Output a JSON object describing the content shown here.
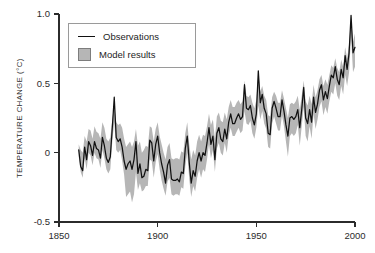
{
  "chart_data": {
    "type": "line",
    "title": "",
    "subtitle": "",
    "xlabel": "",
    "ylabel": "TEMPERATURE CHANGE (°C)",
    "xlim": [
      1850,
      2000
    ],
    "ylim": [
      -0.5,
      1.0
    ],
    "xticks": [
      1850,
      1900,
      1950,
      2000
    ],
    "xtick_labels": [
      "1850",
      "1900",
      "1950",
      "2000"
    ],
    "yticks": [
      -0.5,
      0,
      0.5,
      1.0
    ],
    "ytick_labels": [
      "-0.5",
      "0",
      "0.5",
      "1.0"
    ],
    "grid": false,
    "legend_position": "top-left",
    "legend": [
      {
        "label": "Observations",
        "marker": "line",
        "color": "#111111"
      },
      {
        "label": "Model results",
        "marker": "filled-square",
        "color": "#b6b6b6"
      }
    ],
    "series": [
      {
        "name": "Observations",
        "type": "line",
        "color": "#111111",
        "x": [
          1860,
          1861,
          1862,
          1863,
          1864,
          1865,
          1866,
          1867,
          1868,
          1869,
          1870,
          1871,
          1872,
          1873,
          1874,
          1875,
          1876,
          1877,
          1878,
          1879,
          1880,
          1881,
          1882,
          1883,
          1884,
          1885,
          1886,
          1887,
          1888,
          1889,
          1890,
          1891,
          1892,
          1893,
          1894,
          1895,
          1896,
          1897,
          1898,
          1899,
          1900,
          1901,
          1902,
          1903,
          1904,
          1905,
          1906,
          1907,
          1908,
          1909,
          1910,
          1911,
          1912,
          1913,
          1914,
          1915,
          1916,
          1917,
          1918,
          1919,
          1920,
          1921,
          1922,
          1923,
          1924,
          1925,
          1926,
          1927,
          1928,
          1929,
          1930,
          1931,
          1932,
          1933,
          1934,
          1935,
          1936,
          1937,
          1938,
          1939,
          1940,
          1941,
          1942,
          1943,
          1944,
          1945,
          1946,
          1947,
          1948,
          1949,
          1950,
          1951,
          1952,
          1953,
          1954,
          1955,
          1956,
          1957,
          1958,
          1959,
          1960,
          1961,
          1962,
          1963,
          1964,
          1965,
          1966,
          1967,
          1968,
          1969,
          1970,
          1971,
          1972,
          1973,
          1974,
          1975,
          1976,
          1977,
          1978,
          1979,
          1980,
          1981,
          1982,
          1983,
          1984,
          1985,
          1986,
          1987,
          1988,
          1989,
          1990,
          1991,
          1992,
          1993,
          1994,
          1995,
          1996,
          1997,
          1998,
          1999,
          2000
        ],
        "y": [
          0.02,
          -0.1,
          -0.13,
          0.04,
          -0.05,
          0.08,
          0.05,
          -0.02,
          0.08,
          0.03,
          0.02,
          -0.04,
          0.11,
          0.05,
          -0.04,
          -0.07,
          -0.03,
          0.18,
          0.4,
          0.11,
          0.08,
          0.1,
          0.04,
          -0.06,
          -0.12,
          -0.08,
          -0.06,
          -0.12,
          -0.05,
          0.08,
          -0.15,
          -0.08,
          -0.18,
          -0.17,
          -0.12,
          -0.13,
          0.09,
          0.07,
          -0.06,
          0.06,
          0.12,
          0.0,
          -0.08,
          -0.14,
          -0.22,
          -0.09,
          -0.05,
          -0.19,
          -0.2,
          -0.2,
          -0.19,
          -0.21,
          -0.14,
          -0.15,
          0.03,
          0.12,
          -0.07,
          -0.22,
          -0.13,
          -0.17,
          -0.06,
          0.0,
          -0.06,
          0.0,
          -0.02,
          0.07,
          0.18,
          0.06,
          0.12,
          -0.05,
          0.14,
          0.18,
          0.1,
          0.08,
          0.17,
          0.1,
          0.22,
          0.28,
          0.21,
          0.21,
          0.25,
          0.28,
          0.24,
          0.26,
          0.49,
          0.32,
          0.31,
          0.34,
          0.25,
          0.2,
          0.28,
          0.59,
          0.36,
          0.42,
          0.32,
          0.28,
          0.14,
          0.13,
          0.32,
          0.37,
          0.32,
          0.26,
          0.26,
          0.38,
          0.3,
          0.2,
          0.12,
          0.25,
          0.26,
          0.24,
          0.26,
          0.31,
          0.18,
          0.31,
          0.47,
          0.25,
          0.21,
          0.31,
          0.22,
          0.4,
          0.29,
          0.35,
          0.45,
          0.49,
          0.38,
          0.44,
          0.39,
          0.48,
          0.56,
          0.54,
          0.62,
          0.53,
          0.49,
          0.6,
          0.54,
          0.7,
          0.6,
          0.72,
          0.99,
          0.72,
          0.76
        ]
      },
      {
        "name": "Model results",
        "type": "band",
        "color": "#b6b6b6",
        "x": [
          1860,
          1861,
          1862,
          1863,
          1864,
          1865,
          1866,
          1867,
          1868,
          1869,
          1870,
          1871,
          1872,
          1873,
          1874,
          1875,
          1876,
          1877,
          1878,
          1879,
          1880,
          1881,
          1882,
          1883,
          1884,
          1885,
          1886,
          1887,
          1888,
          1889,
          1890,
          1891,
          1892,
          1893,
          1894,
          1895,
          1896,
          1897,
          1898,
          1899,
          1900,
          1901,
          1902,
          1903,
          1904,
          1905,
          1906,
          1907,
          1908,
          1909,
          1910,
          1911,
          1912,
          1913,
          1914,
          1915,
          1916,
          1917,
          1918,
          1919,
          1920,
          1921,
          1922,
          1923,
          1924,
          1925,
          1926,
          1927,
          1928,
          1929,
          1930,
          1931,
          1932,
          1933,
          1934,
          1935,
          1936,
          1937,
          1938,
          1939,
          1940,
          1941,
          1942,
          1943,
          1944,
          1945,
          1946,
          1947,
          1948,
          1949,
          1950,
          1951,
          1952,
          1953,
          1954,
          1955,
          1956,
          1957,
          1958,
          1959,
          1960,
          1961,
          1962,
          1963,
          1964,
          1965,
          1966,
          1967,
          1968,
          1969,
          1970,
          1971,
          1972,
          1973,
          1974,
          1975,
          1976,
          1977,
          1978,
          1979,
          1980,
          1981,
          1982,
          1983,
          1984,
          1985,
          1986,
          1987,
          1988,
          1989,
          1990,
          1991,
          1992,
          1993,
          1994,
          1995,
          1996,
          1997,
          1998,
          1999,
          2000
        ],
        "y_upper": [
          0.06,
          0.02,
          0.0,
          0.12,
          0.08,
          0.17,
          0.16,
          0.1,
          0.19,
          0.15,
          0.14,
          0.1,
          0.22,
          0.18,
          0.1,
          0.08,
          0.11,
          0.24,
          0.34,
          0.22,
          0.2,
          0.21,
          0.18,
          0.1,
          0.04,
          0.06,
          0.08,
          0.04,
          0.08,
          0.17,
          0.05,
          0.08,
          0.0,
          0.02,
          0.05,
          0.04,
          0.19,
          0.18,
          0.08,
          0.17,
          0.22,
          0.12,
          0.06,
          0.0,
          -0.05,
          0.04,
          0.07,
          -0.04,
          -0.05,
          -0.04,
          -0.04,
          -0.05,
          0.01,
          0.0,
          0.14,
          0.22,
          0.06,
          -0.05,
          0.02,
          -0.02,
          0.08,
          0.13,
          0.08,
          0.13,
          0.12,
          0.19,
          0.28,
          0.2,
          0.24,
          0.1,
          0.26,
          0.29,
          0.23,
          0.22,
          0.29,
          0.24,
          0.33,
          0.38,
          0.33,
          0.33,
          0.36,
          0.38,
          0.35,
          0.37,
          0.52,
          0.41,
          0.4,
          0.42,
          0.36,
          0.32,
          0.38,
          0.57,
          0.44,
          0.48,
          0.41,
          0.38,
          0.27,
          0.26,
          0.4,
          0.44,
          0.41,
          0.36,
          0.36,
          0.45,
          0.39,
          0.32,
          0.25,
          0.35,
          0.36,
          0.35,
          0.37,
          0.41,
          0.31,
          0.41,
          0.52,
          0.37,
          0.34,
          0.41,
          0.35,
          0.49,
          0.4,
          0.45,
          0.53,
          0.56,
          0.48,
          0.53,
          0.49,
          0.56,
          0.63,
          0.61,
          0.68,
          0.61,
          0.58,
          0.67,
          0.62,
          0.76,
          0.68,
          0.78,
          0.98,
          0.8,
          0.86
        ],
        "y_lower": [
          -0.03,
          -0.14,
          -0.18,
          -0.04,
          -0.12,
          0.0,
          -0.02,
          -0.09,
          0.0,
          -0.04,
          -0.05,
          -0.11,
          0.02,
          -0.04,
          -0.12,
          -0.15,
          -0.12,
          0.08,
          0.22,
          0.02,
          0.0,
          0.02,
          -0.06,
          -0.16,
          -0.32,
          -0.3,
          -0.28,
          -0.36,
          -0.3,
          -0.14,
          -0.27,
          -0.22,
          -0.28,
          -0.27,
          -0.24,
          -0.24,
          -0.05,
          -0.06,
          -0.18,
          -0.07,
          -0.01,
          -0.12,
          -0.2,
          -0.26,
          -0.31,
          -0.21,
          -0.18,
          -0.3,
          -0.31,
          -0.3,
          -0.3,
          -0.31,
          -0.25,
          -0.26,
          -0.1,
          0.0,
          -0.19,
          -0.32,
          -0.24,
          -0.28,
          -0.18,
          -0.12,
          -0.18,
          -0.12,
          -0.14,
          -0.05,
          0.06,
          -0.04,
          0.02,
          -0.14,
          0.03,
          0.07,
          0.0,
          -0.02,
          0.07,
          0.0,
          0.12,
          0.18,
          0.12,
          0.12,
          0.15,
          0.18,
          0.14,
          0.16,
          0.3,
          0.21,
          0.2,
          0.23,
          0.14,
          0.1,
          0.18,
          0.34,
          0.24,
          0.3,
          0.21,
          0.17,
          0.04,
          0.03,
          0.21,
          0.26,
          0.21,
          0.16,
          0.16,
          0.27,
          0.19,
          0.08,
          -0.03,
          0.12,
          0.14,
          0.12,
          0.14,
          0.2,
          0.05,
          0.19,
          0.33,
          0.12,
          0.08,
          0.19,
          0.1,
          0.28,
          0.17,
          0.24,
          0.33,
          0.37,
          0.27,
          0.33,
          0.28,
          0.37,
          0.44,
          0.42,
          0.5,
          0.41,
          0.38,
          0.48,
          0.42,
          0.56,
          0.48,
          0.58,
          0.84,
          0.58,
          0.62
        ]
      }
    ]
  },
  "legend": {
    "observations_label": "Observations",
    "model_label": "Model results"
  },
  "axes": {
    "ylabel": "TEMPERATURE CHANGE (°C)"
  },
  "colors": {
    "line": "#111111",
    "band": "#b6b6b6",
    "axis": "#2b2b2b",
    "background": "#ffffff"
  }
}
